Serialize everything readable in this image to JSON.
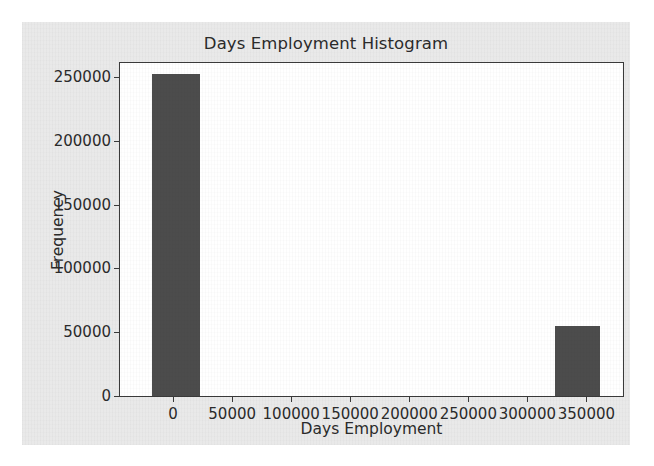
{
  "figure": {
    "background_color": "#e9e9e9",
    "plot_background_color": "#ffffff",
    "axis_color": "#3a3a3a"
  },
  "chart_data": {
    "type": "bar",
    "title": "Days Employment Histogram",
    "xlabel": "Days Employment",
    "ylabel": "Frequency",
    "bar_color": "#4c4c4c",
    "grid": false,
    "legend": null,
    "xlim": [
      -45000,
      381000
    ],
    "ylim": [
      0,
      261000
    ],
    "xticks": [
      0,
      50000,
      100000,
      150000,
      200000,
      250000,
      300000,
      350000
    ],
    "xtick_labels": [
      "0",
      "50000",
      "100000",
      "150000",
      "200000",
      "250000",
      "300000",
      "350000"
    ],
    "yticks": [
      0,
      50000,
      100000,
      150000,
      200000,
      250000
    ],
    "ytick_labels": [
      "0",
      "50000",
      "100000",
      "150000",
      "200000",
      "250000"
    ],
    "bins": [
      {
        "left": -17500,
        "right": 23000,
        "value": 252000
      },
      {
        "left": 323500,
        "right": 361500,
        "value": 55000
      }
    ],
    "categories": [
      "-17500 to 23000",
      "323500 to 361500"
    ],
    "values": [
      252000,
      55000
    ]
  }
}
